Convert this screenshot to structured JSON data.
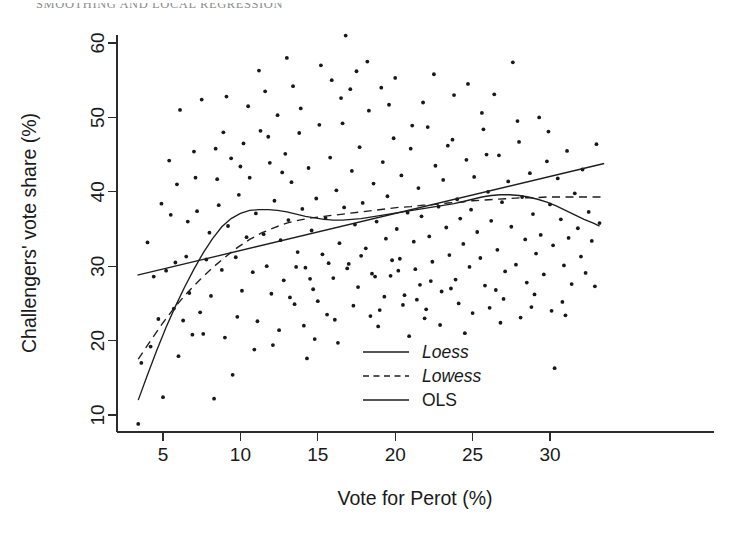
{
  "page": {
    "running_head": "SMOOTHING AND LOCAL REGRESSION"
  },
  "chart_data": {
    "type": "scatter",
    "title": "",
    "xlabel": "Vote for Perot (%)",
    "ylabel": "Challengers' vote share (%)",
    "xlim": [
      3.1,
      33.6
    ],
    "ylim": [
      8.0,
      62.5
    ],
    "xticks": [
      5,
      10,
      15,
      20,
      25,
      30
    ],
    "yticks": [
      10,
      20,
      30,
      40,
      50,
      60
    ],
    "grid": false,
    "legend_position": "center",
    "legend": [
      {
        "name": "Loess",
        "style": "solid",
        "italic": true
      },
      {
        "name": "Lowess",
        "style": "dashed",
        "italic": true
      },
      {
        "name": "OLS",
        "style": "solid",
        "italic": false
      }
    ],
    "point_marker": "filled-circle",
    "point_color": "#181818",
    "line_color": "#1e1e1e",
    "points": [
      [
        3.4,
        8.8
      ],
      [
        3.6,
        17.0
      ],
      [
        4.0,
        33.2
      ],
      [
        4.4,
        28.6
      ],
      [
        4.7,
        22.9
      ],
      [
        5.0,
        12.4
      ],
      [
        5.2,
        29.4
      ],
      [
        5.5,
        36.9
      ],
      [
        5.7,
        24.3
      ],
      [
        5.9,
        41.0
      ],
      [
        6.1,
        51.0
      ],
      [
        6.3,
        22.7
      ],
      [
        6.5,
        31.3
      ],
      [
        6.7,
        26.4
      ],
      [
        6.9,
        20.8
      ],
      [
        7.0,
        45.4
      ],
      [
        7.2,
        37.4
      ],
      [
        7.4,
        23.8
      ],
      [
        7.6,
        20.9
      ],
      [
        7.8,
        30.9
      ],
      [
        8.0,
        34.5
      ],
      [
        8.1,
        26.0
      ],
      [
        8.3,
        12.2
      ],
      [
        8.5,
        41.7
      ],
      [
        8.6,
        38.2
      ],
      [
        8.8,
        29.5
      ],
      [
        9.0,
        20.4
      ],
      [
        9.2,
        35.4
      ],
      [
        9.4,
        44.5
      ],
      [
        9.5,
        15.4
      ],
      [
        9.7,
        31.2
      ],
      [
        9.9,
        39.6
      ],
      [
        10.1,
        26.7
      ],
      [
        10.2,
        46.5
      ],
      [
        10.4,
        33.9
      ],
      [
        10.6,
        41.9
      ],
      [
        10.8,
        29.2
      ],
      [
        11.0,
        37.1
      ],
      [
        11.1,
        22.6
      ],
      [
        11.3,
        48.2
      ],
      [
        11.5,
        34.3
      ],
      [
        11.7,
        30.0
      ],
      [
        11.9,
        43.9
      ],
      [
        12.0,
        26.3
      ],
      [
        12.2,
        38.8
      ],
      [
        12.4,
        50.3
      ],
      [
        12.6,
        33.5
      ],
      [
        12.8,
        28.1
      ],
      [
        12.9,
        45.1
      ],
      [
        13.1,
        36.2
      ],
      [
        13.3,
        41.3
      ],
      [
        13.5,
        24.9
      ],
      [
        13.7,
        31.9
      ],
      [
        13.8,
        47.9
      ],
      [
        14.0,
        37.7
      ],
      [
        14.2,
        29.8
      ],
      [
        14.4,
        43.2
      ],
      [
        14.6,
        34.8
      ],
      [
        14.7,
        26.9
      ],
      [
        14.9,
        39.1
      ],
      [
        15.1,
        49.0
      ],
      [
        15.3,
        31.6
      ],
      [
        15.5,
        36.5
      ],
      [
        15.6,
        23.5
      ],
      [
        15.8,
        44.6
      ],
      [
        16.0,
        28.4
      ],
      [
        16.2,
        40.2
      ],
      [
        16.4,
        33.1
      ],
      [
        16.5,
        52.6
      ],
      [
        16.7,
        37.9
      ],
      [
        16.8,
        61.0
      ],
      [
        17.0,
        30.3
      ],
      [
        17.2,
        42.8
      ],
      [
        17.4,
        35.6
      ],
      [
        17.6,
        27.2
      ],
      [
        17.7,
        46.0
      ],
      [
        17.9,
        38.5
      ],
      [
        18.1,
        32.4
      ],
      [
        18.3,
        50.9
      ],
      [
        18.5,
        29.0
      ],
      [
        18.6,
        41.1
      ],
      [
        18.8,
        36.0
      ],
      [
        19.0,
        24.1
      ],
      [
        19.2,
        44.0
      ],
      [
        19.4,
        33.7
      ],
      [
        19.5,
        39.4
      ],
      [
        19.7,
        28.7
      ],
      [
        19.9,
        47.2
      ],
      [
        20.1,
        35.0
      ],
      [
        20.3,
        31.0
      ],
      [
        20.4,
        42.2
      ],
      [
        20.6,
        26.1
      ],
      [
        20.8,
        37.2
      ],
      [
        21.0,
        45.8
      ],
      [
        21.2,
        33.3
      ],
      [
        21.3,
        29.6
      ],
      [
        21.5,
        40.5
      ],
      [
        21.7,
        36.7
      ],
      [
        21.9,
        23.0
      ],
      [
        22.1,
        48.7
      ],
      [
        22.2,
        34.0
      ],
      [
        22.4,
        30.6
      ],
      [
        22.6,
        43.5
      ],
      [
        22.8,
        38.0
      ],
      [
        23.0,
        26.6
      ],
      [
        23.1,
        41.6
      ],
      [
        23.3,
        35.2
      ],
      [
        23.5,
        31.5
      ],
      [
        23.7,
        47.0
      ],
      [
        23.9,
        28.2
      ],
      [
        24.0,
        39.0
      ],
      [
        24.2,
        36.4
      ],
      [
        24.4,
        33.0
      ],
      [
        24.6,
        44.3
      ],
      [
        24.8,
        29.9
      ],
      [
        24.9,
        37.6
      ],
      [
        25.1,
        42.0
      ],
      [
        25.3,
        34.6
      ],
      [
        25.5,
        31.1
      ],
      [
        25.7,
        48.4
      ],
      [
        25.8,
        27.4
      ],
      [
        26.0,
        40.0
      ],
      [
        26.2,
        36.1
      ],
      [
        26.4,
        53.1
      ],
      [
        26.6,
        32.2
      ],
      [
        26.7,
        44.9
      ],
      [
        26.9,
        38.6
      ],
      [
        27.1,
        29.3
      ],
      [
        27.3,
        41.4
      ],
      [
        27.5,
        35.3
      ],
      [
        27.6,
        57.4
      ],
      [
        27.8,
        30.2
      ],
      [
        28.0,
        46.7
      ],
      [
        28.2,
        39.3
      ],
      [
        28.4,
        33.6
      ],
      [
        28.5,
        27.8
      ],
      [
        28.7,
        42.5
      ],
      [
        28.9,
        37.0
      ],
      [
        29.1,
        31.7
      ],
      [
        29.3,
        50.0
      ],
      [
        29.4,
        34.2
      ],
      [
        29.6,
        28.9
      ],
      [
        29.8,
        44.1
      ],
      [
        30.0,
        38.3
      ],
      [
        30.2,
        32.8
      ],
      [
        30.3,
        16.3
      ],
      [
        30.5,
        41.8
      ],
      [
        30.7,
        36.3
      ],
      [
        30.9,
        30.1
      ],
      [
        31.1,
        45.5
      ],
      [
        31.2,
        33.8
      ],
      [
        31.4,
        27.6
      ],
      [
        31.6,
        39.8
      ],
      [
        31.8,
        35.1
      ],
      [
        32.0,
        31.3
      ],
      [
        32.1,
        43.0
      ],
      [
        32.3,
        29.1
      ],
      [
        32.5,
        37.3
      ],
      [
        32.7,
        33.4
      ],
      [
        32.9,
        27.3
      ],
      [
        33.0,
        46.4
      ],
      [
        33.2,
        35.8
      ],
      [
        4.2,
        19.2
      ],
      [
        5.4,
        44.2
      ],
      [
        6.0,
        17.9
      ],
      [
        7.5,
        52.4
      ],
      [
        8.9,
        48.0
      ],
      [
        9.8,
        23.2
      ],
      [
        10.9,
        18.8
      ],
      [
        11.6,
        53.5
      ],
      [
        12.5,
        21.4
      ],
      [
        13.4,
        54.2
      ],
      [
        14.8,
        20.2
      ],
      [
        15.9,
        55.0
      ],
      [
        16.3,
        19.7
      ],
      [
        17.5,
        56.2
      ],
      [
        18.9,
        21.9
      ],
      [
        19.6,
        51.7
      ],
      [
        20.9,
        20.6
      ],
      [
        21.8,
        52.0
      ],
      [
        22.9,
        22.1
      ],
      [
        23.8,
        53.0
      ],
      [
        24.5,
        21.0
      ],
      [
        25.6,
        50.6
      ],
      [
        26.8,
        22.4
      ],
      [
        27.9,
        49.5
      ],
      [
        28.8,
        24.5
      ],
      [
        29.9,
        48.1
      ],
      [
        30.8,
        25.2
      ],
      [
        12.1,
        19.4
      ],
      [
        13.0,
        58.0
      ],
      [
        14.3,
        17.6
      ],
      [
        15.2,
        57.0
      ],
      [
        11.2,
        56.3
      ],
      [
        10.5,
        51.5
      ],
      [
        9.1,
        52.8
      ],
      [
        8.4,
        45.8
      ],
      [
        7.1,
        41.9
      ],
      [
        6.6,
        36.0
      ],
      [
        5.8,
        30.5
      ],
      [
        4.9,
        38.4
      ],
      [
        18.2,
        57.5
      ],
      [
        19.1,
        54.0
      ],
      [
        20.0,
        55.3
      ],
      [
        21.1,
        48.9
      ],
      [
        22.5,
        55.8
      ],
      [
        23.4,
        46.2
      ],
      [
        24.7,
        54.5
      ],
      [
        25.9,
        45.0
      ],
      [
        17.1,
        53.8
      ],
      [
        16.6,
        49.2
      ],
      [
        13.9,
        51.2
      ],
      [
        12.7,
        42.6
      ],
      [
        11.8,
        47.4
      ],
      [
        10.0,
        43.4
      ],
      [
        20.5,
        24.8
      ],
      [
        21.4,
        25.5
      ],
      [
        22.0,
        24.2
      ],
      [
        19.3,
        25.9
      ],
      [
        18.4,
        23.3
      ],
      [
        17.3,
        24.7
      ],
      [
        16.1,
        22.8
      ],
      [
        15.0,
        25.3
      ],
      [
        14.1,
        22.0
      ],
      [
        13.2,
        25.8
      ],
      [
        24.1,
        25.0
      ],
      [
        25.0,
        23.7
      ],
      [
        26.1,
        24.4
      ],
      [
        27.0,
        25.6
      ],
      [
        28.1,
        23.1
      ],
      [
        29.0,
        26.2
      ],
      [
        30.1,
        24.0
      ],
      [
        31.0,
        23.4
      ],
      [
        26.5,
        26.8
      ],
      [
        23.6,
        27.0
      ],
      [
        22.3,
        28.0
      ],
      [
        21.6,
        27.5
      ],
      [
        20.2,
        29.4
      ],
      [
        19.8,
        30.8
      ],
      [
        18.7,
        28.6
      ],
      [
        17.8,
        31.4
      ],
      [
        16.9,
        29.7
      ],
      [
        15.7,
        30.4
      ],
      [
        14.5,
        28.3
      ],
      [
        13.6,
        29.9
      ]
    ],
    "curves": [
      {
        "name": "Loess",
        "style": "solid",
        "points": [
          [
            3.4,
            12.0
          ],
          [
            4.0,
            15.4
          ],
          [
            4.6,
            18.7
          ],
          [
            5.2,
            21.8
          ],
          [
            5.8,
            24.6
          ],
          [
            6.4,
            27.2
          ],
          [
            7.0,
            29.6
          ],
          [
            7.6,
            31.8
          ],
          [
            8.2,
            33.7
          ],
          [
            8.8,
            35.3
          ],
          [
            9.4,
            36.4
          ],
          [
            10.0,
            37.1
          ],
          [
            10.6,
            37.5
          ],
          [
            11.2,
            37.6
          ],
          [
            11.8,
            37.6
          ],
          [
            12.4,
            37.5
          ],
          [
            13.0,
            37.3
          ],
          [
            13.6,
            37.0
          ],
          [
            14.2,
            36.7
          ],
          [
            14.8,
            36.5
          ],
          [
            15.4,
            36.3
          ],
          [
            16.0,
            36.2
          ],
          [
            16.6,
            36.2
          ],
          [
            17.2,
            36.3
          ],
          [
            17.8,
            36.4
          ],
          [
            18.4,
            36.6
          ],
          [
            19.0,
            36.8
          ],
          [
            19.6,
            37.0
          ],
          [
            20.2,
            37.2
          ],
          [
            20.8,
            37.4
          ],
          [
            21.4,
            37.6
          ],
          [
            22.0,
            37.8
          ],
          [
            22.6,
            38.0
          ],
          [
            23.2,
            38.2
          ],
          [
            23.8,
            38.4
          ],
          [
            24.4,
            38.7
          ],
          [
            25.0,
            39.0
          ],
          [
            25.6,
            39.3
          ],
          [
            26.2,
            39.5
          ],
          [
            26.8,
            39.6
          ],
          [
            27.4,
            39.6
          ],
          [
            28.0,
            39.5
          ],
          [
            28.6,
            39.3
          ],
          [
            29.2,
            39.0
          ],
          [
            29.8,
            38.6
          ],
          [
            30.4,
            38.1
          ],
          [
            31.0,
            37.5
          ],
          [
            31.6,
            36.9
          ],
          [
            32.2,
            36.3
          ],
          [
            32.8,
            35.8
          ],
          [
            33.2,
            35.4
          ]
        ]
      },
      {
        "name": "Lowess",
        "style": "dashed",
        "points": [
          [
            3.4,
            17.5
          ],
          [
            4.2,
            20.0
          ],
          [
            5.0,
            22.4
          ],
          [
            5.8,
            24.6
          ],
          [
            6.6,
            26.5
          ],
          [
            7.4,
            28.2
          ],
          [
            8.2,
            29.8
          ],
          [
            9.0,
            31.2
          ],
          [
            9.8,
            32.5
          ],
          [
            10.6,
            33.6
          ],
          [
            11.4,
            34.5
          ],
          [
            12.2,
            35.2
          ],
          [
            13.0,
            35.8
          ],
          [
            13.8,
            36.2
          ],
          [
            14.6,
            36.5
          ],
          [
            15.4,
            36.7
          ],
          [
            16.2,
            36.9
          ],
          [
            17.0,
            37.1
          ],
          [
            17.8,
            37.3
          ],
          [
            18.6,
            37.5
          ],
          [
            19.4,
            37.7
          ],
          [
            20.2,
            37.9
          ],
          [
            21.0,
            38.0
          ],
          [
            21.8,
            38.2
          ],
          [
            22.6,
            38.3
          ],
          [
            23.4,
            38.5
          ],
          [
            24.2,
            38.6
          ],
          [
            25.0,
            38.8
          ],
          [
            25.8,
            38.9
          ],
          [
            26.6,
            39.0
          ],
          [
            27.4,
            39.1
          ],
          [
            28.2,
            39.2
          ],
          [
            29.0,
            39.2
          ],
          [
            29.8,
            39.3
          ],
          [
            30.6,
            39.3
          ],
          [
            31.4,
            39.3
          ],
          [
            32.2,
            39.3
          ],
          [
            33.0,
            39.3
          ],
          [
            33.4,
            39.3
          ]
        ]
      },
      {
        "name": "OLS",
        "style": "solid",
        "points": [
          [
            3.35,
            28.8
          ],
          [
            33.5,
            43.8
          ]
        ]
      }
    ]
  }
}
